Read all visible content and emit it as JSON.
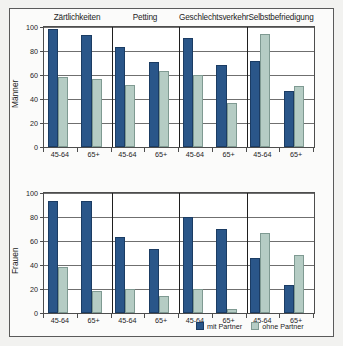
{
  "chart_data": {
    "type": "bar",
    "title": "",
    "grid": true,
    "legend_position": "bottom-right",
    "categories": [
      "Zärtlichkeiten",
      "Petting",
      "Geschlechtsverkehr",
      "Selbstbefriedigung"
    ],
    "age_groups": [
      "45-64",
      "65+"
    ],
    "x": [
      "Zärtlichkeiten 45-64",
      "Zärtlichkeiten 65+",
      "Petting 45-64",
      "Petting 65+",
      "Geschlechtsverkehr 45-64",
      "Geschlechtsverkehr 65+",
      "Selbstbefriedigung 45-64",
      "Selbstbefriedigung 65+"
    ],
    "xlabel": "",
    "ylim": [
      0,
      100
    ],
    "yticks": [
      0,
      20,
      40,
      60,
      80,
      100
    ],
    "panels": [
      {
        "ylabel": "Männer",
        "series": [
          {
            "name": "mit Partner",
            "values": [
              98,
              93,
              83,
              71,
              91,
              68,
              72,
              47
            ]
          },
          {
            "name": "ohne Partner",
            "values": [
              58,
              57,
              52,
              63,
              60,
              37,
              94,
              51
            ]
          }
        ]
      },
      {
        "ylabel": "Frauen",
        "series": [
          {
            "name": "mit Partner",
            "values": [
              93,
              93,
              63,
              53,
              80,
              70,
              46,
              23
            ]
          },
          {
            "name": "ohne Partner",
            "values": [
              38,
              18,
              20,
              14,
              20,
              3,
              67,
              48
            ]
          }
        ]
      }
    ],
    "legend": [
      {
        "label": "mit Partner",
        "color": "#2a5689"
      },
      {
        "label": "ohne Partner",
        "color": "#b5ccc4"
      }
    ]
  },
  "colors": {
    "with_partner": "#2a5689",
    "without_partner": "#b5ccc4",
    "frame": "#5a5a5a",
    "grid": "#6f6f6f",
    "background": "#f2f2f0"
  }
}
